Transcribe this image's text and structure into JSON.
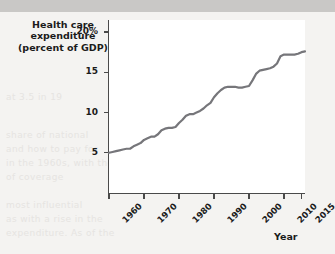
{
  "figure": {
    "title_lines": [
      "Health care",
      "expenditure",
      "(percent of GDP)"
    ],
    "line_color": "#76767a",
    "axis_color": "#4a4a4a",
    "plot_background": "#ffffff",
    "page_background": "#f4f3f1"
  },
  "axis_x_title": "Year",
  "background_text": {
    "l1": "at 3.5 in 19",
    "l2": "share of national",
    "l3": "and how to pay for",
    "l4": "in the 1960s, with the",
    "l5": "of coverage",
    "l6": "most influential",
    "l7": "as with a rise in the",
    "l8": "expenditure. As of the"
  },
  "chart_data": {
    "type": "line",
    "title": "Health care expenditure (percent of GDP)",
    "xlabel": "Year",
    "ylabel": "Health care expenditure (percent of GDP)",
    "xlim": [
      1960,
      2016
    ],
    "ylim": [
      0,
      21.5
    ],
    "grid": false,
    "legend": null,
    "x_ticks": [
      1960,
      1970,
      1980,
      1990,
      2000,
      2010,
      2015
    ],
    "x_tick_labels": [
      "1960",
      "1970",
      "1980",
      "1990",
      "2000",
      "2010",
      "2015"
    ],
    "y_ticks": [
      5,
      10,
      15,
      20
    ],
    "y_tick_labels": [
      "5",
      "10",
      "15",
      "20%"
    ],
    "series": [
      {
        "name": "Health care expenditure (percent of GDP)",
        "color": "#76767a",
        "x": [
          1960,
          1961,
          1962,
          1963,
          1964,
          1965,
          1966,
          1967,
          1968,
          1969,
          1970,
          1971,
          1972,
          1973,
          1974,
          1975,
          1976,
          1977,
          1978,
          1979,
          1980,
          1981,
          1982,
          1983,
          1984,
          1985,
          1986,
          1987,
          1988,
          1989,
          1990,
          1991,
          1992,
          1993,
          1994,
          1995,
          1996,
          1997,
          1998,
          1999,
          2000,
          2001,
          2002,
          2003,
          2004,
          2005,
          2006,
          2007,
          2008,
          2009,
          2010,
          2011,
          2012,
          2013,
          2014,
          2015,
          2016
        ],
        "values": [
          5.0,
          5.1,
          5.2,
          5.3,
          5.4,
          5.5,
          5.5,
          5.8,
          6.0,
          6.2,
          6.6,
          6.8,
          7.0,
          7.0,
          7.3,
          7.8,
          8.0,
          8.1,
          8.1,
          8.2,
          8.7,
          9.1,
          9.6,
          9.8,
          9.8,
          10.0,
          10.2,
          10.5,
          10.9,
          11.2,
          11.9,
          12.4,
          12.8,
          13.1,
          13.2,
          13.2,
          13.2,
          13.1,
          13.1,
          13.2,
          13.3,
          14.0,
          14.8,
          15.2,
          15.3,
          15.4,
          15.5,
          15.7,
          16.1,
          17.0,
          17.2,
          17.2,
          17.2,
          17.2,
          17.3,
          17.5,
          17.6
        ]
      }
    ]
  }
}
